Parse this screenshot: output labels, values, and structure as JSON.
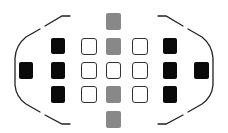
{
  "diagram": {
    "colors": {
      "cross_type": "#0a0a0a",
      "center_column": "#888888",
      "line_type_border": "#333333",
      "frame": "#222222",
      "background": "#ffffff"
    },
    "points": [
      {
        "id": "far-left",
        "type": "cross",
        "x": 19,
        "y": 62,
        "w": 14,
        "h": 17
      },
      {
        "id": "left-top",
        "type": "cross",
        "x": 51,
        "y": 38,
        "w": 14,
        "h": 16
      },
      {
        "id": "left-mid",
        "type": "cross",
        "x": 51,
        "y": 62,
        "w": 14,
        "h": 17
      },
      {
        "id": "left-bottom",
        "type": "cross",
        "x": 51,
        "y": 86,
        "w": 14,
        "h": 17
      },
      {
        "id": "inner-left-top",
        "type": "line",
        "x": 81,
        "y": 38,
        "w": 16,
        "h": 17
      },
      {
        "id": "inner-left-mid",
        "type": "line",
        "x": 81,
        "y": 62,
        "w": 16,
        "h": 17
      },
      {
        "id": "inner-left-bottom",
        "type": "line",
        "x": 81,
        "y": 86,
        "w": 16,
        "h": 17
      },
      {
        "id": "center-top-outer",
        "type": "center",
        "x": 106,
        "y": 13,
        "w": 15,
        "h": 17
      },
      {
        "id": "center-top",
        "type": "center",
        "x": 106,
        "y": 38,
        "w": 15,
        "h": 17
      },
      {
        "id": "center-mid",
        "type": "line",
        "x": 106,
        "y": 62,
        "w": 15,
        "h": 17
      },
      {
        "id": "center-bottom",
        "type": "center",
        "x": 106,
        "y": 86,
        "w": 15,
        "h": 17
      },
      {
        "id": "center-bottom-outer",
        "type": "center",
        "x": 106,
        "y": 111,
        "w": 15,
        "h": 17
      },
      {
        "id": "inner-right-top",
        "type": "line",
        "x": 132,
        "y": 38,
        "w": 16,
        "h": 17
      },
      {
        "id": "inner-right-mid",
        "type": "line",
        "x": 132,
        "y": 62,
        "w": 16,
        "h": 17
      },
      {
        "id": "inner-right-bottom",
        "type": "line",
        "x": 132,
        "y": 86,
        "w": 16,
        "h": 17
      },
      {
        "id": "right-top",
        "type": "cross",
        "x": 163,
        "y": 38,
        "w": 14,
        "h": 16
      },
      {
        "id": "right-mid",
        "type": "cross",
        "x": 163,
        "y": 62,
        "w": 14,
        "h": 17
      },
      {
        "id": "right-bottom",
        "type": "cross",
        "x": 163,
        "y": 86,
        "w": 14,
        "h": 17
      },
      {
        "id": "far-right",
        "type": "cross",
        "x": 194,
        "y": 62,
        "w": 15,
        "h": 17
      }
    ],
    "frame": {
      "left_bracket": "M70 16 L62 16 L45 26 M40 29 L26 37 Q16 45 15 58 L15 85 Q16 97 26 104 L40 112 M45 115 L62 124 L70 124",
      "right_bracket": "M158 16 L166 16 L183 26 M188 29 L202 37 Q212 45 213 58 L213 85 Q212 97 202 104 L188 112 M183 115 L166 124 L158 124"
    }
  }
}
